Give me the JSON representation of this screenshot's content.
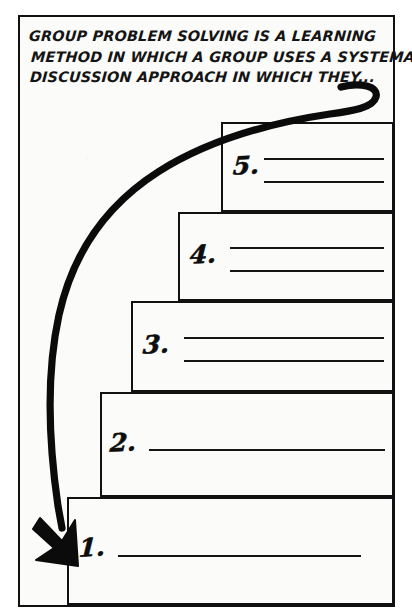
{
  "worksheet": {
    "prompt": {
      "line1": "GROUP PROBLEM SOLVING IS A LEARNING",
      "line2": "METHOD IN WHICH A GROUP USES A SYSTEMATIC",
      "line3": "DISCUSSION APPROACH IN WHICH THEY..."
    },
    "arrow": {
      "name": "curved-arrow",
      "description": "thick curved arrow sweeping from end of prompt text down the left side to step 1",
      "color": "#0b0b0b"
    },
    "steps": [
      {
        "number": "5.",
        "answer_lines": 2,
        "answer_values": [
          "",
          ""
        ]
      },
      {
        "number": "4.",
        "answer_lines": 2,
        "answer_values": [
          "",
          ""
        ]
      },
      {
        "number": "3.",
        "answer_lines": 2,
        "answer_values": [
          "",
          ""
        ]
      },
      {
        "number": "2.",
        "answer_lines": 1,
        "answer_values": [
          ""
        ]
      },
      {
        "number": "1.",
        "answer_lines": 1,
        "answer_values": [
          ""
        ]
      }
    ],
    "colors": {
      "ink": "#111111",
      "paper": "#fbfbf9",
      "page": "#ffffff"
    }
  }
}
